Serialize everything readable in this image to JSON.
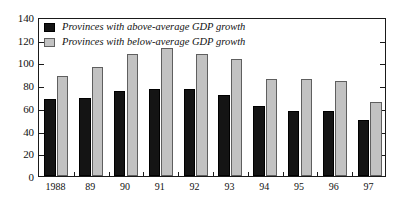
{
  "chart_data": {
    "type": "bar",
    "title": "",
    "xlabel": "",
    "ylabel": "",
    "categories": [
      "1988",
      "89",
      "90",
      "91",
      "92",
      "93",
      "94",
      "95",
      "96",
      "97"
    ],
    "series": [
      {
        "name": "Provinces with above-average GDP growth",
        "color": "#141414",
        "values": [
          68,
          69,
          75,
          77,
          77,
          71,
          62,
          57,
          57,
          49
        ]
      },
      {
        "name": "Provinces with below-average GDP growth",
        "color": "#c2c2c2",
        "values": [
          88,
          96,
          107,
          113,
          107,
          103,
          85,
          85,
          84,
          65
        ]
      }
    ],
    "ylim": [
      0,
      140
    ],
    "ytick_labels": [
      "0",
      "20",
      "40",
      "60",
      "80",
      "100",
      "120",
      "140"
    ],
    "ytick_values": [
      0,
      20,
      40,
      60,
      80,
      100,
      120,
      140
    ],
    "grid": false,
    "legend_position": "top-left"
  },
  "legend": {
    "entries": [
      {
        "label": "Provinces with above-average GDP growth",
        "swatch": "black-square"
      },
      {
        "label": "Provinces with below-average GDP growth",
        "swatch": "gray-square"
      }
    ]
  }
}
